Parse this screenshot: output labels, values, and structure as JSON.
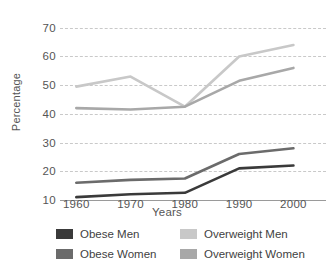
{
  "chart_data": {
    "type": "line",
    "title": "",
    "xlabel": "Years",
    "ylabel": "Percentage",
    "x": [
      1960,
      1970,
      1980,
      1990,
      2000
    ],
    "categories": [
      "1960",
      "1970",
      "1980",
      "1990",
      "2000"
    ],
    "xtick_labels": [
      "1960",
      "1970",
      "1980",
      "1990",
      "2000"
    ],
    "ytick_labels": [
      "10",
      "20",
      "30",
      "40",
      "50",
      "60",
      "70"
    ],
    "yticks": [
      10,
      20,
      30,
      40,
      50,
      60,
      70
    ],
    "ylim": [
      10,
      72
    ],
    "xlim": [
      1957,
      2006
    ],
    "grid": true,
    "grid_style": "dashed-horizontal",
    "legend_position": "bottom",
    "series": [
      {
        "name": "Obese Men",
        "color": "#3a3a3a",
        "values": [
          11,
          12,
          12.5,
          21,
          22
        ]
      },
      {
        "name": "Obese Women",
        "color": "#6b6b6b",
        "values": [
          16,
          17,
          17.5,
          26,
          28
        ]
      },
      {
        "name": "Overweight Men",
        "color": "#c8c8c8",
        "values": [
          49.5,
          53,
          42.5,
          60,
          64
        ]
      },
      {
        "name": "Overweight Women",
        "color": "#a8a8a8",
        "values": [
          42,
          41.5,
          42.5,
          51.5,
          56
        ]
      }
    ]
  },
  "legend": {
    "items": [
      {
        "label": "Obese Men",
        "color": "#3a3a3a"
      },
      {
        "label": "Obese Women",
        "color": "#6b6b6b"
      },
      {
        "label": "Overweight Men",
        "color": "#c8c8c8"
      },
      {
        "label": "Overweight Women",
        "color": "#a8a8a8"
      }
    ]
  },
  "axes": {
    "y_title": "Percentage",
    "x_title": "Years"
  },
  "colors": {
    "background": "#ffffff",
    "grid": "#c9c9c9",
    "axis": "#9a9a9a",
    "text": "#555555"
  }
}
